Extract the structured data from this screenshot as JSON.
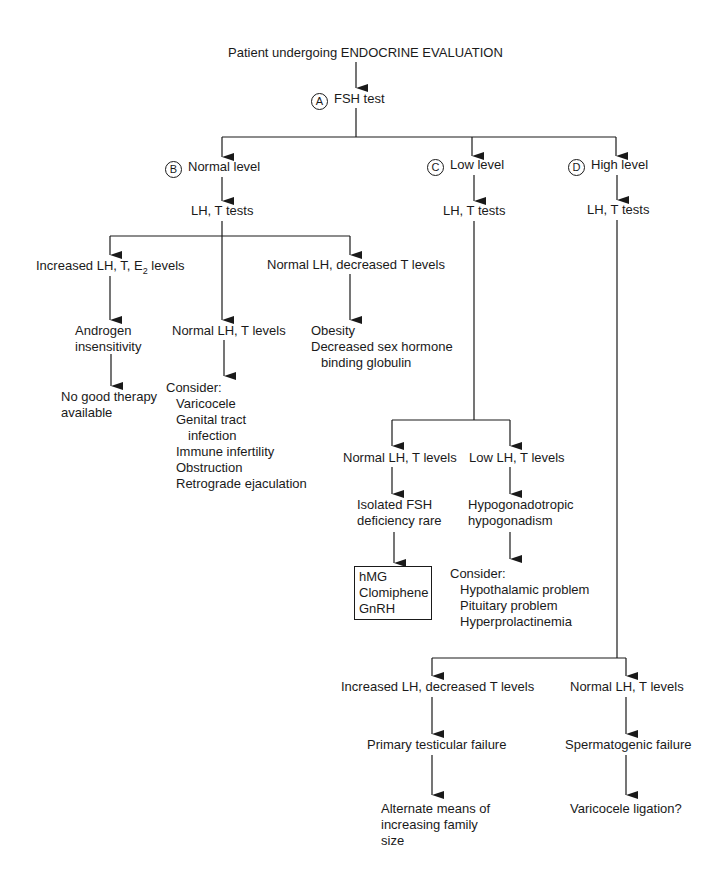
{
  "title": "Patient undergoing ENDOCRINE EVALUATION",
  "nodes": {
    "a": {
      "marker": "A",
      "label": "FSH test"
    },
    "b": {
      "marker": "B",
      "label": "Normal level"
    },
    "c": {
      "marker": "C",
      "label": "Low level"
    },
    "d": {
      "marker": "D",
      "label": "High level"
    },
    "b_tests": "LH, T tests",
    "c_tests": "LH, T tests",
    "d_tests": "LH, T tests",
    "b1": {
      "label_pre": "Increased LH, T, E",
      "label_sub": "2",
      "label_post": " levels"
    },
    "b1_result": [
      "Androgen",
      "insensitivity"
    ],
    "b1_outcome": [
      "No good therapy",
      "available"
    ],
    "b2": "Normal LH, T levels",
    "b2_consider": {
      "heading": "Consider:",
      "items": [
        "Varicocele",
        "Genital tract",
        "  infection",
        "Immune infertility",
        "Obstruction",
        "Retrograde ejaculation"
      ]
    },
    "b3": "Normal LH, decreased T levels",
    "b3_result": [
      "Obesity",
      "Decreased sex hormone",
      "binding globulin"
    ],
    "c1": "Normal LH, T levels",
    "c1_result": [
      "Isolated FSH",
      "deficiency rare"
    ],
    "c1_box": [
      "hMG",
      "Clomiphene",
      "GnRH"
    ],
    "c2": "Low LH, T levels",
    "c2_result": [
      "Hypogonadotropic",
      "hypogonadism"
    ],
    "c2_consider": {
      "heading": "Consider:",
      "items": [
        "Hypothalamic problem",
        "Pituitary problem",
        "Hyperprolactinemia"
      ]
    },
    "d1": "Increased LH, decreased T levels",
    "d1_result": "Primary testicular failure",
    "d1_outcome": [
      "Alternate means of",
      "increasing family",
      "size"
    ],
    "d2": "Normal LH, T levels",
    "d2_result": "Spermatogenic failure",
    "d2_outcome": "Varicocele ligation?"
  },
  "colors": {
    "ink": "#1a1a1a",
    "background": "#ffffff"
  }
}
